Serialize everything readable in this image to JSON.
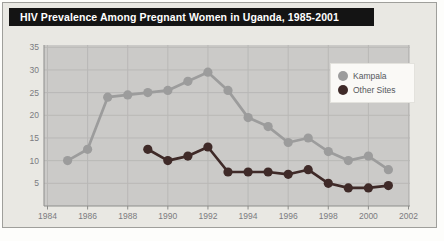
{
  "window": {
    "title": "HIV Prevalence Among Pregnant Women in Uganda, 1985-2001"
  },
  "chart_data": {
    "type": "line",
    "title": "HIV Prevalence Among Pregnant Women in Uganda, 1985-2001",
    "xlabel": "",
    "ylabel": "",
    "xlim": [
      1984,
      2002
    ],
    "ylim": [
      0,
      35.5
    ],
    "x_ticks": [
      1984,
      1986,
      1988,
      1990,
      1992,
      1994,
      1996,
      1998,
      2000,
      2002
    ],
    "y_ticks": [
      5,
      10,
      15,
      20,
      25,
      30,
      35
    ],
    "grid": true,
    "legend_position": "top-right",
    "series": [
      {
        "name": "Kampala",
        "color": "#9c9c9c",
        "x": [
          1985,
          1986,
          1987,
          1988,
          1989,
          1990,
          1991,
          1992,
          1993,
          1994,
          1995,
          1996,
          1997,
          1998,
          1999,
          2000,
          2001
        ],
        "values": [
          10,
          12.5,
          24,
          24.5,
          25,
          25.5,
          27.5,
          29.5,
          25.5,
          19.5,
          17.5,
          14,
          15,
          12,
          10,
          11,
          8
        ]
      },
      {
        "name": "Other Sites",
        "color": "#3f2a28",
        "x": [
          1989,
          1990,
          1991,
          1992,
          1993,
          1994,
          1995,
          1996,
          1997,
          1998,
          1999,
          2000,
          2001
        ],
        "values": [
          12.5,
          10,
          11,
          13,
          7.5,
          7.5,
          7.5,
          7,
          8,
          5,
          4,
          4,
          4.5
        ]
      }
    ]
  },
  "colors": {
    "page_bg": "#fdfdfb",
    "figure_bg": "#e9e8e3",
    "border": "#9f9f9b",
    "title_bar_bg": "#141414",
    "title_text": "#ffffff",
    "plot_bg": "#cbcac8",
    "grid": "#b9b8b6",
    "axis": "#8d8d8b",
    "tick_label": "#7b7b80",
    "legend_bg": "#faf9f6"
  }
}
